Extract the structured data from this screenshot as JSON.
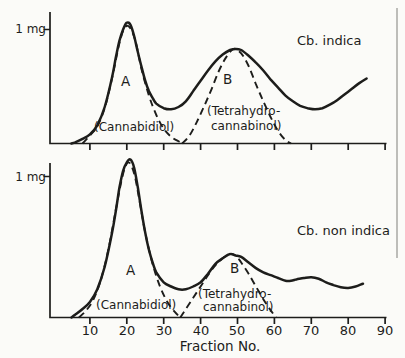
{
  "figure": {
    "background": "#fbfbf8",
    "ink": "#1d1d1b",
    "kind": "chromatography elution profiles, two stacked charts"
  },
  "top_chart": {
    "title": "Cb. indica",
    "ylabel": "1 mg",
    "peak_a": "A",
    "peak_b": "B",
    "cannabidiol": "(Cannabidiol)",
    "thc_line1": "(Tetrahydro-",
    "thc_line2": "cannabinol)"
  },
  "bottom_chart": {
    "title": "Cb. non indica",
    "ylabel": "1 mg",
    "peak_a": "A",
    "peak_b": "B",
    "cannabidiol": "(Cannabidiol)",
    "thc_line1": "(Tetrahydro-",
    "thc_line2": "cannabinol)"
  },
  "x_axis": {
    "label": "Fraction No.",
    "ticks": [
      "10",
      "20",
      "30",
      "40",
      "50",
      "60",
      "70",
      "80",
      "90"
    ]
  },
  "chart_data": [
    {
      "type": "line",
      "title": "Cb. indica",
      "xlabel": "Fraction No.",
      "ylabel": "1 mg",
      "xlim": [
        0,
        92
      ],
      "ylim": [
        0,
        1.25
      ],
      "y_unit": "mg",
      "grid": false,
      "legend": "none",
      "peaks": [
        {
          "label": "A",
          "fraction": 20,
          "mg": 1.06,
          "compound": "Cannabidiol"
        },
        {
          "label": "B",
          "fraction": 49.5,
          "mg": 0.83,
          "compound": "Tetrahydrocannabinol"
        }
      ],
      "series": [
        {
          "name": "Total eluate",
          "style": "solid",
          "points": [
            [
              5,
              0
            ],
            [
              6,
              0.01
            ],
            [
              8,
              0.04
            ],
            [
              10,
              0.08
            ],
            [
              12,
              0.16
            ],
            [
              14,
              0.32
            ],
            [
              16,
              0.58
            ],
            [
              17,
              0.75
            ],
            [
              18,
              0.9
            ],
            [
              19,
              1.0
            ],
            [
              20,
              1.06
            ],
            [
              21,
              1.04
            ],
            [
              22,
              0.94
            ],
            [
              23,
              0.8
            ],
            [
              24,
              0.67
            ],
            [
              25,
              0.55
            ],
            [
              26,
              0.46
            ],
            [
              27,
              0.4
            ],
            [
              28,
              0.35
            ],
            [
              30,
              0.31
            ],
            [
              32,
              0.3
            ],
            [
              34,
              0.32
            ],
            [
              36,
              0.37
            ],
            [
              38,
              0.46
            ],
            [
              40,
              0.55
            ],
            [
              42,
              0.64
            ],
            [
              44,
              0.72
            ],
            [
              46,
              0.78
            ],
            [
              48,
              0.82
            ],
            [
              49.5,
              0.83
            ],
            [
              51,
              0.82
            ],
            [
              53,
              0.77
            ],
            [
              55,
              0.71
            ],
            [
              57,
              0.64
            ],
            [
              59,
              0.56
            ],
            [
              61,
              0.49
            ],
            [
              63,
              0.42
            ],
            [
              65,
              0.37
            ],
            [
              67,
              0.33
            ],
            [
              69,
              0.31
            ],
            [
              71,
              0.3
            ],
            [
              73,
              0.31
            ],
            [
              75,
              0.34
            ],
            [
              77,
              0.38
            ],
            [
              79,
              0.43
            ],
            [
              81,
              0.48
            ],
            [
              83,
              0.53
            ],
            [
              85,
              0.57
            ]
          ]
        },
        {
          "name": "Cannabidiol",
          "style": "dashed",
          "points": [
            [
              8,
              0
            ],
            [
              10,
              0.07
            ],
            [
              12,
              0.15
            ],
            [
              14,
              0.31
            ],
            [
              16,
              0.57
            ],
            [
              18,
              0.88
            ],
            [
              19.5,
              1.02
            ],
            [
              21,
              1.01
            ],
            [
              22.5,
              0.88
            ],
            [
              24,
              0.65
            ],
            [
              26,
              0.42
            ],
            [
              28,
              0.25
            ],
            [
              30,
              0.13
            ],
            [
              32,
              0.06
            ],
            [
              34,
              0.02
            ],
            [
              35.5,
              0
            ]
          ]
        },
        {
          "name": "Tetrahydrocannabinol",
          "style": "dashed",
          "points": [
            [
              35,
              0
            ],
            [
              37,
              0.07
            ],
            [
              39,
              0.19
            ],
            [
              41,
              0.33
            ],
            [
              43,
              0.48
            ],
            [
              45,
              0.64
            ],
            [
              47,
              0.76
            ],
            [
              49,
              0.83
            ],
            [
              51,
              0.79
            ],
            [
              53,
              0.68
            ],
            [
              55,
              0.52
            ],
            [
              57,
              0.37
            ],
            [
              59,
              0.23
            ],
            [
              61,
              0.11
            ],
            [
              63,
              0.03
            ],
            [
              64.5,
              0
            ]
          ]
        }
      ]
    },
    {
      "type": "line",
      "title": "Cb. non indica",
      "xlabel": "Fraction No.",
      "ylabel": "1 mg",
      "xlim": [
        0,
        92
      ],
      "ylim": [
        0,
        1.25
      ],
      "y_unit": "mg",
      "grid": false,
      "legend": "none",
      "peaks": [
        {
          "label": "A",
          "fraction": 21,
          "mg": 1.12,
          "compound": "Cannabidiol"
        },
        {
          "label": "B",
          "fraction": 48,
          "mg": 0.45,
          "compound": "Tetrahydrocannabinol"
        }
      ],
      "series": [
        {
          "name": "Total eluate",
          "style": "solid",
          "points": [
            [
              5,
              0
            ],
            [
              6,
              0.02
            ],
            [
              8,
              0.06
            ],
            [
              10,
              0.11
            ],
            [
              12,
              0.2
            ],
            [
              14,
              0.36
            ],
            [
              16,
              0.6
            ],
            [
              17,
              0.75
            ],
            [
              18,
              0.92
            ],
            [
              19,
              1.04
            ],
            [
              20,
              1.1
            ],
            [
              21,
              1.12
            ],
            [
              22,
              1.06
            ],
            [
              23,
              0.92
            ],
            [
              24,
              0.75
            ],
            [
              25,
              0.6
            ],
            [
              26,
              0.48
            ],
            [
              27,
              0.39
            ],
            [
              28,
              0.32
            ],
            [
              30,
              0.25
            ],
            [
              32,
              0.22
            ],
            [
              34,
              0.2
            ],
            [
              36,
              0.2
            ],
            [
              38,
              0.22
            ],
            [
              40,
              0.25
            ],
            [
              42,
              0.31
            ],
            [
              44,
              0.38
            ],
            [
              46,
              0.42
            ],
            [
              48,
              0.45
            ],
            [
              49.5,
              0.44
            ],
            [
              51,
              0.43
            ],
            [
              53,
              0.39
            ],
            [
              55,
              0.35
            ],
            [
              57,
              0.32
            ],
            [
              59,
              0.3
            ],
            [
              61,
              0.28
            ],
            [
              63,
              0.26
            ],
            [
              64.5,
              0.26
            ],
            [
              66,
              0.27
            ],
            [
              68,
              0.28
            ],
            [
              70,
              0.285
            ],
            [
              72,
              0.275
            ],
            [
              74,
              0.25
            ],
            [
              76,
              0.23
            ],
            [
              78,
              0.215
            ],
            [
              80,
              0.21
            ],
            [
              82,
              0.22
            ],
            [
              84,
              0.24
            ]
          ]
        },
        {
          "name": "Cannabidiol",
          "style": "dashed",
          "points": [
            [
              7,
              0
            ],
            [
              9,
              0.05
            ],
            [
              11,
              0.13
            ],
            [
              13,
              0.27
            ],
            [
              15,
              0.48
            ],
            [
              17,
              0.76
            ],
            [
              19,
              1.02
            ],
            [
              20.5,
              1.1
            ],
            [
              22,
              1.02
            ],
            [
              23.5,
              0.82
            ],
            [
              25,
              0.6
            ],
            [
              27,
              0.38
            ],
            [
              29,
              0.22
            ],
            [
              31,
              0.11
            ],
            [
              33,
              0.04
            ],
            [
              34.5,
              0
            ]
          ]
        },
        {
          "name": "Tetrahydrocannabinol",
          "style": "dashed",
          "points": [
            [
              34.5,
              0
            ],
            [
              36,
              0.06
            ],
            [
              38,
              0.14
            ],
            [
              40,
              0.22
            ],
            [
              42,
              0.3
            ],
            [
              44,
              0.37
            ],
            [
              46,
              0.42
            ],
            [
              48,
              0.45
            ],
            [
              49.5,
              0.44
            ],
            [
              51,
              0.39
            ],
            [
              53,
              0.31
            ],
            [
              55,
              0.22
            ],
            [
              57,
              0.13
            ],
            [
              59,
              0.05
            ],
            [
              60.5,
              0
            ]
          ]
        }
      ]
    }
  ]
}
